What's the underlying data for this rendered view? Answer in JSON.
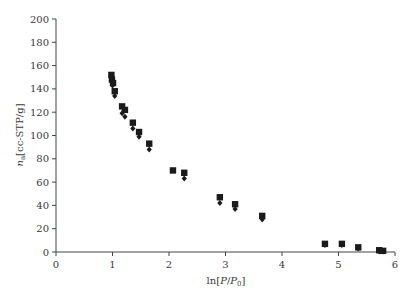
{
  "chart_data": {
    "type": "scatter",
    "title": "",
    "xlabel": "ln[P/P0]",
    "ylabel": "n_a[cc-STP/g]",
    "xlim": [
      0,
      6
    ],
    "ylim": [
      0,
      200
    ],
    "x_ticks": [
      "0",
      "1",
      "2",
      "3",
      "4",
      "5",
      "6"
    ],
    "y_ticks": [
      "0",
      "20",
      "40",
      "60",
      "80",
      "100",
      "120",
      "140",
      "160",
      "180",
      "200"
    ],
    "grid": false,
    "legend": null,
    "series": [
      {
        "name": "squares",
        "marker": "square",
        "color": "#1a1a1a",
        "points": [
          [
            0.98,
            152
          ],
          [
            0.99,
            148
          ],
          [
            1.01,
            145
          ],
          [
            1.04,
            138
          ],
          [
            1.17,
            125
          ],
          [
            1.22,
            122
          ],
          [
            1.36,
            111
          ],
          [
            1.47,
            103
          ],
          [
            1.65,
            93
          ],
          [
            2.07,
            70
          ],
          [
            2.27,
            68
          ],
          [
            2.9,
            47
          ],
          [
            3.17,
            41
          ],
          [
            3.65,
            31
          ],
          [
            4.76,
            7
          ],
          [
            5.06,
            7
          ],
          [
            5.35,
            4
          ],
          [
            5.72,
            1.5
          ],
          [
            5.79,
            1
          ]
        ]
      },
      {
        "name": "diamonds",
        "marker": "diamond",
        "color": "#1a1a1a",
        "points": [
          [
            0.99,
            149
          ],
          [
            1.0,
            143
          ],
          [
            1.04,
            134
          ],
          [
            1.17,
            119
          ],
          [
            1.22,
            116
          ],
          [
            1.36,
            106
          ],
          [
            1.47,
            99
          ],
          [
            1.65,
            88
          ],
          [
            2.27,
            63
          ],
          [
            2.9,
            42
          ],
          [
            3.17,
            37
          ],
          [
            3.65,
            28
          ],
          [
            4.76,
            6
          ],
          [
            5.06,
            6
          ],
          [
            5.35,
            3
          ],
          [
            5.72,
            0.5
          ],
          [
            5.79,
            0.5
          ]
        ]
      }
    ]
  },
  "labels": {
    "x_title_prefix": "ln[",
    "x_title_P": "P",
    "x_title_slash": "/",
    "x_title_P0": "P",
    "x_title_sub": "0",
    "x_title_suffix": "]",
    "y_title_n": "n",
    "y_title_sub": "a",
    "y_title_rest": "[cc-STP/g]"
  }
}
